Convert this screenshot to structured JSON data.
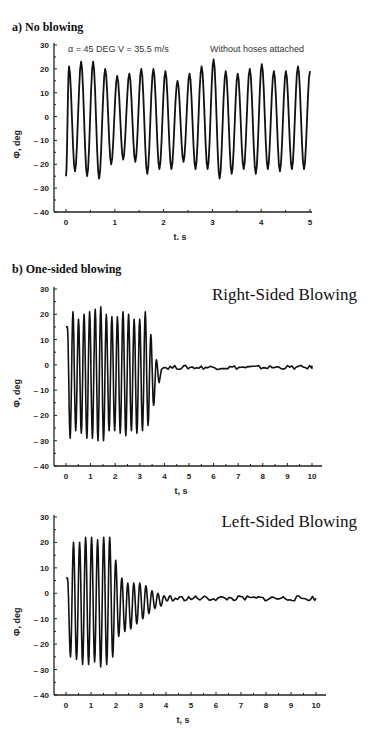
{
  "sections": {
    "a_title": "a) No blowing",
    "b_title": "b) One-sided blowing"
  },
  "chart_data": [
    {
      "type": "line",
      "title": "a) No blowing",
      "annotations": [
        "α = 45 DEG  V = 35.5 m/s",
        "Without hoses attached"
      ],
      "xlabel": "t, s",
      "ylabel": "Φ, deg",
      "xlim": [
        0,
        5
      ],
      "ylim": [
        -40,
        30
      ],
      "xticks": [
        0,
        1,
        2,
        3,
        4,
        5
      ],
      "yticks": [
        30,
        20,
        10,
        0,
        -10,
        -20,
        -30,
        -40
      ],
      "series": [
        {
          "name": "Φ(t)",
          "start": -25,
          "cycles": 19,
          "duration": 5,
          "peaks": [
            21,
            23,
            23,
            20,
            17,
            18,
            20,
            20,
            19,
            15,
            18,
            21,
            24,
            19,
            18,
            20,
            22,
            19,
            19,
            21,
            19
          ],
          "troughs": [
            -23,
            -25,
            -26,
            -20,
            -18,
            -19,
            -24,
            -22,
            -22,
            -19,
            -22,
            -22,
            -26,
            -24,
            -22,
            -24,
            -22,
            -23,
            -22,
            -22
          ]
        }
      ]
    },
    {
      "type": "line",
      "title": "Right-Sided Blowing",
      "xlabel": "t, s",
      "ylabel": "Φ, deg",
      "xlim": [
        0,
        10
      ],
      "ylim": [
        -40,
        30
      ],
      "xticks": [
        0,
        1,
        2,
        3,
        4,
        5,
        6,
        7,
        8,
        9,
        10
      ],
      "yticks": [
        30,
        20,
        10,
        0,
        -10,
        -20,
        -30,
        -40
      ],
      "series": [
        {
          "name": "Φ(t)",
          "start": 15,
          "osc_end": 3.9,
          "cycles": 19,
          "peaks": [
            15,
            21,
            18,
            20,
            21,
            22,
            23,
            20,
            19,
            19,
            21,
            20,
            18,
            18,
            21,
            12,
            2
          ],
          "troughs": [
            -29,
            -26,
            -27,
            -29,
            -29,
            -30,
            -30,
            -26,
            -26,
            -27,
            -28,
            -26,
            -27,
            -26,
            -24,
            -16,
            -7
          ],
          "settled_value": -1,
          "settled_noise": 0.8
        }
      ]
    },
    {
      "type": "line",
      "title": "Left-Sided Blowing",
      "xlabel": "t, s",
      "ylabel": "Φ, deg",
      "xlim": [
        0,
        10
      ],
      "ylim": [
        -40,
        30
      ],
      "xticks": [
        0,
        1,
        2,
        3,
        4,
        5,
        6,
        7,
        8,
        9,
        10
      ],
      "yticks": [
        30,
        20,
        10,
        0,
        -10,
        -20,
        -30,
        -40
      ],
      "series": [
        {
          "name": "Φ(t)",
          "start": 6,
          "osc_end": 4.4,
          "peaks": [
            6,
            20,
            20,
            22,
            22,
            21,
            22,
            22,
            13,
            6,
            4,
            4,
            4,
            3,
            1,
            0,
            -1,
            -1
          ],
          "troughs": [
            -25,
            -26,
            -28,
            -28,
            -27,
            -29,
            -28,
            -25,
            -17,
            -15,
            -14,
            -12,
            -10,
            -8,
            -6,
            -5,
            -3,
            -3
          ],
          "settled_value": -2,
          "settled_noise": 1.0
        }
      ]
    }
  ]
}
